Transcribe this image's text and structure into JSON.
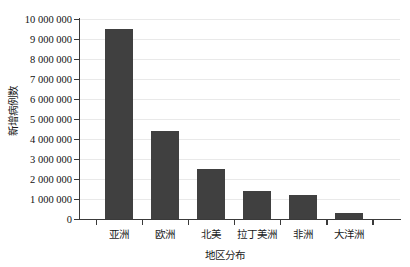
{
  "chart_data": {
    "type": "bar",
    "title": "",
    "subtitle": "",
    "xlabel": "地区分布",
    "ylabel": "新增病例数",
    "categories": [
      "亚洲",
      "欧洲",
      "北美",
      "拉丁美洲",
      "非洲",
      "大洋洲"
    ],
    "values": [
      9500000,
      4400000,
      2500000,
      1400000,
      1200000,
      300000
    ],
    "ylim": [
      0,
      10000000
    ],
    "ytick_step": 1000000,
    "ytick_labels": [
      "10 000 000",
      "9 000 000",
      "8 000 000",
      "7 000 000",
      "6 000 000",
      "5 000 000",
      "4 000 000",
      "3 000 000",
      "2 000 000",
      "1 000 000",
      "0"
    ],
    "ytick_values": [
      10000000,
      9000000,
      8000000,
      7000000,
      6000000,
      5000000,
      4000000,
      3000000,
      2000000,
      1000000,
      0
    ],
    "grid": true,
    "grid_axis": "y",
    "legend": false,
    "legend_position": "none",
    "bar_color": "#404040",
    "grid_color": "#e9e9e9",
    "axis_color": "#3a3a3a",
    "background_color": "#ffffff",
    "series": [
      {
        "name": "新增病例数",
        "values": [
          9500000,
          4400000,
          2500000,
          1400000,
          1200000,
          300000
        ]
      }
    ]
  }
}
